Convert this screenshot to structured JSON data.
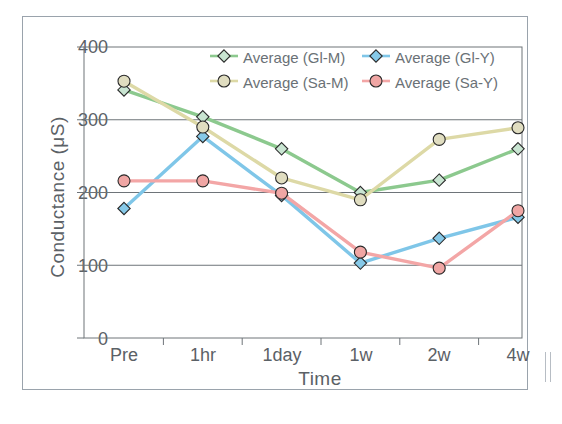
{
  "chart_data": {
    "type": "line",
    "title": "",
    "xlabel": "Time",
    "ylabel": "Conductance (μS)",
    "categories": [
      "Pre",
      "1hr",
      "1day",
      "1w",
      "2w",
      "4w"
    ],
    "ylim": [
      0,
      400
    ],
    "yticks": [
      "0",
      "100",
      "200",
      "300",
      "400"
    ],
    "grid": "horizontal",
    "legend_position": "top-right-inside",
    "series": [
      {
        "name": "Average (Gl-M)",
        "color": "#8cc98e",
        "marker": "diamond",
        "marker_fill": "#c9e5d2",
        "values": [
          341,
          304,
          260,
          200,
          217,
          260
        ]
      },
      {
        "name": "Average (Gl-Y)",
        "color": "#7fc6e8",
        "marker": "diamond",
        "marker_fill": "#86c9e8",
        "values": [
          178,
          277,
          196,
          103,
          137,
          166
        ]
      },
      {
        "name": "Average (Sa-M)",
        "color": "#ddd9a6",
        "marker": "circle",
        "marker_fill": "#e0ddc0",
        "values": [
          353,
          290,
          220,
          190,
          273,
          289
        ]
      },
      {
        "name": "Average (Sa-Y)",
        "color": "#f3a6a6",
        "marker": "circle",
        "marker_fill": "#f0a6a4",
        "values": [
          216,
          216,
          199,
          118,
          96,
          175
        ]
      }
    ]
  },
  "legend": {
    "items": [
      {
        "label": "Average (Gl-M)"
      },
      {
        "label": "Average (Gl-Y)"
      },
      {
        "label": "Average (Sa-M)"
      },
      {
        "label": "Average (Sa-Y)"
      }
    ]
  },
  "axes": {
    "y_title": "Conductance (μS)",
    "x_title": "Time",
    "y_ticks": [
      "400",
      "300",
      "200",
      "100",
      "0"
    ],
    "x_ticks": [
      "Pre",
      "1hr",
      "1day",
      "1w",
      "2w",
      "4w"
    ]
  },
  "colors": {
    "frame": "#9aa3ac",
    "grid": "#6e7479",
    "text": "#5b6166"
  }
}
